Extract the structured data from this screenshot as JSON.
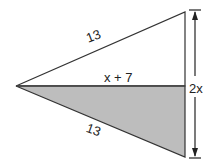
{
  "diagram": {
    "type": "geometry",
    "shapes": {
      "upper_triangle": {
        "fill": "#ffffff",
        "stroke": "#333333"
      },
      "lower_triangle": {
        "fill": "#bdbdbd",
        "stroke": "#333333"
      }
    },
    "labels": {
      "upper_hypotenuse": "13",
      "lower_hypotenuse": "13",
      "shared_side": "x + 7",
      "height": "2x"
    }
  }
}
